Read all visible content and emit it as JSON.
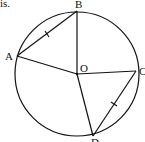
{
  "caption_fragment": "is.",
  "diagram": {
    "type": "circle-geometry",
    "center": {
      "label": "O",
      "x": 77,
      "y": 74
    },
    "radius": 62,
    "points": [
      {
        "label": "A",
        "x": 17,
        "y": 56
      },
      {
        "label": "B",
        "x": 77,
        "y": 11
      },
      {
        "label": "C",
        "x": 136,
        "y": 71
      },
      {
        "label": "D",
        "x": 93,
        "y": 136
      }
    ],
    "segments": [
      "AB",
      "OA",
      "OB",
      "OC",
      "OD",
      "CD"
    ],
    "equal_marks": [
      "AB",
      "CD"
    ],
    "stroke_color": "#111111"
  }
}
